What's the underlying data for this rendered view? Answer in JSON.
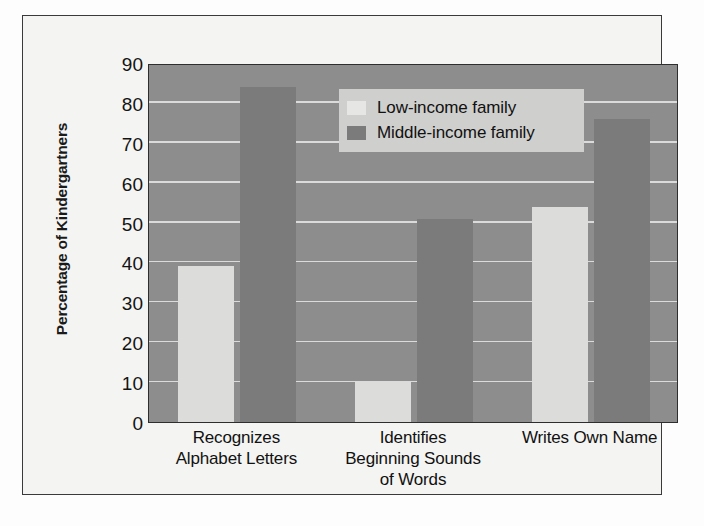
{
  "figure": {
    "frame_color": "#3a3a3a",
    "page_background": "#fdfdfd"
  },
  "chart_data": {
    "type": "bar",
    "title": "",
    "xlabel": "",
    "ylabel": "Percentage of Kindergartners",
    "ylim": [
      0,
      90
    ],
    "ytick_step": 10,
    "yticks": [
      "90",
      "80",
      "70",
      "60",
      "50",
      "40",
      "30",
      "20",
      "10",
      "0"
    ],
    "grid": true,
    "legend_position": "top-center",
    "categories": [
      "Recognizes Alphabet Letters",
      "Identifies Beginning Sounds of Words",
      "Writes Own Name"
    ],
    "category_lines": [
      [
        "Recognizes",
        "Alphabet Letters"
      ],
      [
        "Identifies",
        "Beginning Sounds",
        "of Words"
      ],
      [
        "Writes Own Name"
      ]
    ],
    "series": [
      {
        "name": "Low-income family",
        "color": "#dcdcda",
        "values": [
          39,
          10,
          54
        ]
      },
      {
        "name": "Middle-income family",
        "color": "#7b7b7b",
        "values": [
          84,
          51,
          76
        ]
      }
    ],
    "plot_background": "#8d8d8d",
    "gridline_color": "#e9e9e9"
  },
  "legend": {
    "background": "#cfcfcd",
    "entries": [
      {
        "label": "Low-income family",
        "color": "#e6e6e4"
      },
      {
        "label": "Middle-income family",
        "color": "#7b7b7b"
      }
    ]
  }
}
